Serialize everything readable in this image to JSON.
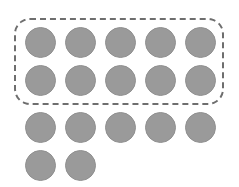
{
  "canvas": {
    "width": 239,
    "height": 187,
    "background_color": "#ffffff",
    "description": "counting-dots-array"
  },
  "palette": {
    "dot_fill": "#9a9a9a",
    "dot_stroke": "#909090",
    "selection_border": "#6e6e6e",
    "background": "#ffffff"
  },
  "selection_box": {
    "label": "dashed-selection-rectangle",
    "x": 14,
    "y": 18,
    "width": 210,
    "height": 87,
    "corner_radius": 16,
    "border_width": 2,
    "border_style": "dashed",
    "border_color": "#6e6e6e",
    "encloses_rows": [
      1,
      2
    ],
    "enclosed_count": 10
  },
  "dot_grid": {
    "total_count": 17,
    "diameter": 31,
    "column_spacing": 40,
    "row_spacing": 38,
    "first_column_center_x": 40,
    "first_row_center_y": 42,
    "rows": [
      {
        "row_index": 1,
        "count": 5,
        "center_y": 42,
        "inside_selection": true,
        "dots": [
          {
            "index": 1,
            "cx": 40,
            "cy": 42,
            "r": 15.5
          },
          {
            "index": 2,
            "cx": 80,
            "cy": 42,
            "r": 15.5
          },
          {
            "index": 3,
            "cx": 120,
            "cy": 42,
            "r": 15.5
          },
          {
            "index": 4,
            "cx": 160,
            "cy": 42,
            "r": 15.5
          },
          {
            "index": 5,
            "cx": 200,
            "cy": 42,
            "r": 15.5
          }
        ]
      },
      {
        "row_index": 2,
        "count": 5,
        "center_y": 80,
        "inside_selection": true,
        "dots": [
          {
            "index": 1,
            "cx": 40,
            "cy": 80,
            "r": 15.5
          },
          {
            "index": 2,
            "cx": 80,
            "cy": 80,
            "r": 15.5
          },
          {
            "index": 3,
            "cx": 120,
            "cy": 80,
            "r": 15.5
          },
          {
            "index": 4,
            "cx": 160,
            "cy": 80,
            "r": 15.5
          },
          {
            "index": 5,
            "cx": 200,
            "cy": 80,
            "r": 15.5
          }
        ]
      },
      {
        "row_index": 3,
        "count": 5,
        "center_y": 127,
        "inside_selection": false,
        "dots": [
          {
            "index": 1,
            "cx": 40,
            "cy": 127,
            "r": 15.5
          },
          {
            "index": 2,
            "cx": 80,
            "cy": 127,
            "r": 15.5
          },
          {
            "index": 3,
            "cx": 120,
            "cy": 127,
            "r": 15.5
          },
          {
            "index": 4,
            "cx": 160,
            "cy": 127,
            "r": 15.5
          },
          {
            "index": 5,
            "cx": 200,
            "cy": 127,
            "r": 15.5
          }
        ]
      },
      {
        "row_index": 4,
        "count": 2,
        "center_y": 165,
        "inside_selection": false,
        "dots": [
          {
            "index": 1,
            "cx": 40,
            "cy": 165,
            "r": 15.5
          },
          {
            "index": 2,
            "cx": 80,
            "cy": 165,
            "r": 15.5
          }
        ]
      }
    ]
  }
}
